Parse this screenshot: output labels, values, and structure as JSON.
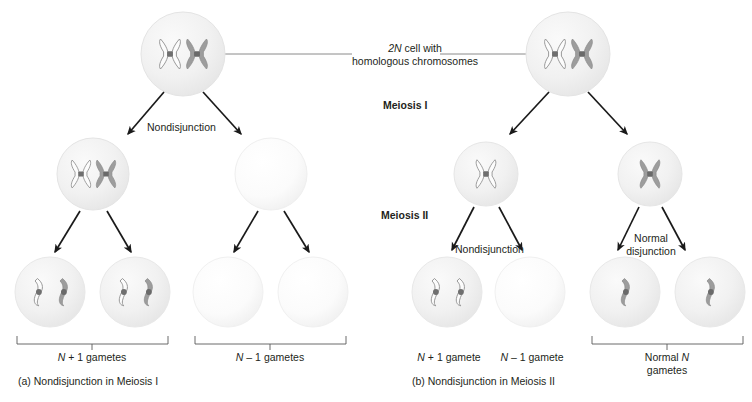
{
  "figure": {
    "title_note": "Nondisjunction in meiosis diagram",
    "center_label_line1": "2N cell with",
    "center_label_line2": "homologous chromosomes",
    "center_label_full": "2N cell with homologous chromosomes",
    "stage_labels": {
      "meiosis_1": "Meiosis I",
      "meiosis_2": "Meiosis II"
    },
    "colors": {
      "cell_fill": "#f0f0f0",
      "cell_edge": "#e2e2e2",
      "chromosome_dark": "#9a9a9a",
      "chromosome_light": "#fbfbfb",
      "chromosome_outline": "#8d8d8d",
      "centromere": "#6e6e6e",
      "arrow": "#1a1a1a",
      "leader_line": "#8a8a8a",
      "text": "#231f20"
    }
  },
  "panel_a": {
    "caption": "(a) Nondisjunction in Meiosis I",
    "event_label": "Nondisjunction",
    "top_cell": {
      "name": "parent-cell",
      "chromosomes": [
        "light-duplicated",
        "dark-duplicated"
      ]
    },
    "meiosis1_cells": [
      {
        "name": "cell-with-both",
        "chromosomes": [
          "light-duplicated",
          "dark-duplicated"
        ]
      },
      {
        "name": "empty-cell",
        "chromosomes": []
      }
    ],
    "gametes": [
      {
        "name": "gamete-1",
        "chromosomes": [
          "light-single",
          "dark-single"
        ]
      },
      {
        "name": "gamete-2",
        "chromosomes": [
          "light-single",
          "dark-single"
        ]
      },
      {
        "name": "gamete-3",
        "chromosomes": []
      },
      {
        "name": "gamete-4",
        "chromosomes": []
      }
    ],
    "bracket_labels": [
      {
        "text": "N + 1 gametes",
        "n_italic": "N",
        "rest": " + 1 gametes"
      },
      {
        "text": "N – 1 gametes",
        "n_italic": "N",
        "rest": " – 1 gametes"
      }
    ]
  },
  "panel_b": {
    "caption": "(b) Nondisjunction in Meiosis II",
    "event_label_left": "Nondisjunction",
    "event_label_right_line1": "Normal",
    "event_label_right_line2": "disjunction",
    "top_cell": {
      "name": "parent-cell",
      "chromosomes": [
        "light-duplicated",
        "dark-duplicated"
      ]
    },
    "meiosis1_cells": [
      {
        "name": "cell-light",
        "chromosomes": [
          "light-duplicated"
        ]
      },
      {
        "name": "cell-dark",
        "chromosomes": [
          "dark-duplicated"
        ]
      }
    ],
    "gametes": [
      {
        "name": "gamete-1",
        "chromosomes": [
          "light-single",
          "light-single"
        ]
      },
      {
        "name": "gamete-2",
        "chromosomes": []
      },
      {
        "name": "gamete-3",
        "chromosomes": [
          "dark-single"
        ]
      },
      {
        "name": "gamete-4",
        "chromosomes": [
          "dark-single"
        ]
      }
    ],
    "labels": [
      {
        "text": "N + 1 gamete",
        "n_italic": "N",
        "rest": " + 1 gamete"
      },
      {
        "text": "N – 1 gamete",
        "n_italic": "N",
        "rest": " – 1 gamete"
      }
    ],
    "bracket_label": {
      "text": "Normal N gametes",
      "pre": "Normal ",
      "n_italic": "N",
      "rest": " gametes"
    }
  }
}
